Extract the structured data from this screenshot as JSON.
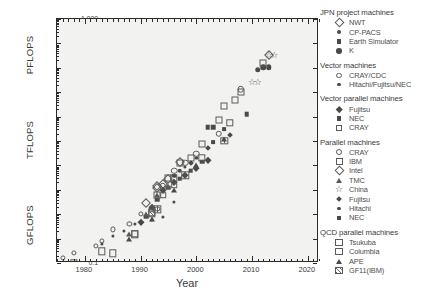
{
  "chart_data": {
    "type": "scatter",
    "title": "",
    "xlabel": "Year",
    "ylabel": "",
    "xlim": [
      1975,
      2022
    ],
    "xticks": [
      1980,
      1990,
      2000,
      2010,
      2020
    ],
    "ylim_log10": [
      -1,
      9
    ],
    "y_unit_groups": [
      {
        "label": "GFLOPS",
        "ticks": [
          "0.1",
          "1",
          "10",
          "100"
        ]
      },
      {
        "label": "TFLOPS",
        "ticks": [
          "1",
          "10",
          "100"
        ]
      },
      {
        "label": "PFLOPS",
        "ticks": [
          "1",
          "10",
          "100",
          "1,000"
        ]
      }
    ],
    "yticks_labels": [
      "1,000",
      "100",
      "10",
      "1",
      "100",
      "10",
      "1",
      "100",
      "10",
      "1",
      "0.1"
    ],
    "grid": false,
    "legend_position": "right-outside",
    "series": [
      {
        "name": "NWT",
        "group": "JPN project machines",
        "marker": "diamond-open",
        "points": [
          [
            1993,
            124
          ],
          [
            1994,
            170
          ]
        ]
      },
      {
        "name": "CP-PACS",
        "group": "JPN project machines",
        "marker": "circle-filled",
        "points": [
          [
            1996,
            368
          ],
          [
            1997,
            614
          ]
        ]
      },
      {
        "name": "Earth Simulator",
        "group": "JPN project machines",
        "marker": "square-filled",
        "points": [
          [
            2002,
            35860
          ],
          [
            2003,
            35860
          ],
          [
            2009,
            122400
          ]
        ]
      },
      {
        "name": "K",
        "group": "JPN project machines",
        "marker": "circle-filled-lg",
        "points": [
          [
            2011,
            8162000
          ],
          [
            2012,
            10510000
          ],
          [
            2013,
            10510000
          ]
        ]
      },
      {
        "name": "CRAY/CDC",
        "group": "Vector machines",
        "marker": "circle-open-sm",
        "points": [
          [
            1976,
            0.16
          ],
          [
            1978,
            0.25
          ],
          [
            1982,
            0.5
          ],
          [
            1983,
            0.8
          ],
          [
            1985,
            2.4
          ],
          [
            1988,
            4.0
          ],
          [
            1990,
            10
          ],
          [
            1993,
            16
          ]
        ]
      },
      {
        "name": "Hitachi/Fujitsu/NEC",
        "group": "Vector machines",
        "marker": "circle-filled-sm",
        "points": [
          [
            1983,
            0.6
          ],
          [
            1985,
            1.3
          ],
          [
            1987,
            2.0
          ],
          [
            1989,
            4.0
          ],
          [
            1992,
            6.0
          ],
          [
            1994,
            8.0
          ],
          [
            1996,
            32
          ]
        ]
      },
      {
        "name": "Fujitsu",
        "group": "Vector parallel machines",
        "marker": "diamond-filled",
        "points": [
          [
            1990,
            5
          ],
          [
            1992,
            20
          ],
          [
            1994,
            100
          ],
          [
            1996,
            200
          ],
          [
            1998,
            400
          ],
          [
            2000,
            800
          ],
          [
            2002,
            1600
          ]
        ]
      },
      {
        "name": "NEC",
        "group": "Vector parallel machines",
        "marker": "square-filled",
        "points": [
          [
            1991,
            8
          ],
          [
            1993,
            40
          ],
          [
            1995,
            120
          ],
          [
            1997,
            280
          ],
          [
            1999,
            600
          ],
          [
            2001,
            1400
          ]
        ]
      },
      {
        "name": "CRAY",
        "group": "Vector parallel machines",
        "marker": "square-open-sm",
        "points": [
          [
            1992,
            16
          ],
          [
            1994,
            60
          ],
          [
            1996,
            150
          ]
        ]
      },
      {
        "name": "CRAY",
        "group": "Parallel machines",
        "marker": "circle-open",
        "points": [
          [
            1994,
            140
          ],
          [
            1996,
            600
          ],
          [
            1998,
            1300
          ],
          [
            2000,
            3000
          ],
          [
            2004,
            20000
          ],
          [
            2008,
            1350000
          ]
        ]
      },
      {
        "name": "IBM",
        "group": "Parallel machines",
        "marker": "square-open",
        "points": [
          [
            1993,
            60
          ],
          [
            1995,
            300
          ],
          [
            1997,
            1300
          ],
          [
            1999,
            2100
          ],
          [
            2001,
            7200
          ],
          [
            2004,
            70720
          ],
          [
            2005,
            280600
          ],
          [
            2007,
            478200
          ],
          [
            2008,
            1026000
          ],
          [
            2012,
            16320000
          ]
        ]
      },
      {
        "name": "Intel",
        "group": "Parallel machines",
        "marker": "diamond-open",
        "points": [
          [
            1991,
            30
          ],
          [
            1993,
            143
          ],
          [
            1995,
            281
          ],
          [
            1997,
            1338
          ],
          [
            2013,
            33860000
          ]
        ]
      },
      {
        "name": "TMC",
        "group": "Parallel machines",
        "marker": "triangle-open",
        "points": [
          [
            1988,
            1.5
          ],
          [
            1991,
            10
          ],
          [
            1993,
            59
          ],
          [
            1995,
            140
          ]
        ]
      },
      {
        "name": "China",
        "group": "Parallel machines",
        "marker": "star-open",
        "points": [
          [
            2010,
            2566000
          ],
          [
            2011,
            2566000
          ],
          [
            2013,
            33860000
          ],
          [
            2014,
            33860000
          ]
        ]
      },
      {
        "name": "Fujitsu",
        "group": "Parallel machines",
        "marker": "diamond-filled-sm",
        "points": [
          [
            1999,
            1200
          ],
          [
            2002,
            5000
          ],
          [
            2006,
            18000
          ]
        ]
      },
      {
        "name": "Hitachi",
        "group": "Parallel machines",
        "marker": "circle-filled-sm",
        "points": [
          [
            1996,
            220
          ],
          [
            1998,
            900
          ],
          [
            2000,
            2000
          ]
        ]
      },
      {
        "name": "NEC",
        "group": "Parallel machines",
        "marker": "square-filled-sm",
        "points": [
          [
            2003,
            9000
          ],
          [
            2005,
            30000
          ]
        ]
      },
      {
        "name": "Tsukuba",
        "group": "QCD parallel machines",
        "marker": "square-open-qcd",
        "points": [
          [
            1978,
            0.1
          ],
          [
            1983,
            0.3
          ],
          [
            1989,
            1.5
          ],
          [
            1992,
            12
          ],
          [
            1996,
            300
          ],
          [
            2001,
            2000
          ],
          [
            2006,
            57000
          ]
        ]
      },
      {
        "name": "Columbia",
        "group": "QCD parallel machines",
        "marker": "square-grid",
        "points": [
          [
            1985,
            0.25
          ],
          [
            1989,
            1.6
          ],
          [
            1993,
            16
          ],
          [
            1998,
            400
          ],
          [
            2005,
            10000
          ]
        ]
      },
      {
        "name": "APE",
        "group": "QCD parallel machines",
        "marker": "triangle-filled",
        "points": [
          [
            1988,
            1.0
          ],
          [
            1992,
            6.4
          ],
          [
            1996,
            100
          ],
          [
            2000,
            1000
          ],
          [
            2005,
            12000
          ]
        ]
      },
      {
        "name": "GF11(IBM)",
        "group": "QCD parallel machines",
        "marker": "square-hatch",
        "points": [
          [
            1992,
            11
          ]
        ]
      }
    ]
  },
  "axes": {
    "x_title": "Year",
    "x_ticks": [
      "1980",
      "1990",
      "2000",
      "2010",
      "2020"
    ],
    "y_unit_labels": [
      "PFLOPS",
      "TFLOPS",
      "GFLOPS"
    ],
    "y_tick_labels": [
      "1,000",
      "100",
      "10",
      "1",
      "100",
      "10",
      "1",
      "100",
      "10",
      "1",
      "0.1"
    ]
  },
  "legend": {
    "groups": [
      {
        "title": "JPN project machines",
        "items": [
          {
            "label": "NWT",
            "marker": "diamond-open"
          },
          {
            "label": "CP-PACS",
            "marker": "circle-filled"
          },
          {
            "label": "Earth Simulator",
            "marker": "square-filled"
          },
          {
            "label": "K",
            "marker": "circle-filled-lg"
          }
        ]
      },
      {
        "title": "Vector machines",
        "items": [
          {
            "label": "CRAY/CDC",
            "marker": "circle-open-sm"
          },
          {
            "label": "Hitachi/Fujitsu/NEC",
            "marker": "circle-filled-sm"
          }
        ]
      },
      {
        "title": "Vector parallel machines",
        "items": [
          {
            "label": "Fujitsu",
            "marker": "diamond-filled"
          },
          {
            "label": "NEC",
            "marker": "square-filled"
          },
          {
            "label": "CRAY",
            "marker": "square-open-sm"
          }
        ]
      },
      {
        "title": "Parallel machines",
        "items": [
          {
            "label": "CRAY",
            "marker": "circle-open"
          },
          {
            "label": "IBM",
            "marker": "square-open"
          },
          {
            "label": "Intel",
            "marker": "diamond-open"
          },
          {
            "label": "TMC",
            "marker": "triangle-open"
          },
          {
            "label": "China",
            "marker": "star-open"
          },
          {
            "label": "Fujitsu",
            "marker": "diamond-filled-sm"
          },
          {
            "label": "Hitachi",
            "marker": "circle-filled-sm"
          },
          {
            "label": "NEC",
            "marker": "square-filled-sm"
          }
        ]
      },
      {
        "title": "QCD parallel machines",
        "items": [
          {
            "label": "Tsukuba",
            "marker": "square-open-qcd"
          },
          {
            "label": "Columbia",
            "marker": "square-grid"
          },
          {
            "label": "APE",
            "marker": "triangle-filled"
          },
          {
            "label": "GF11(IBM)",
            "marker": "square-hatch"
          }
        ]
      }
    ]
  },
  "colors": {
    "frame": "#2b2b2b",
    "plot_background": "#f2f2f0",
    "marker": "#4a4a4a",
    "text": "#3a3a3a"
  }
}
